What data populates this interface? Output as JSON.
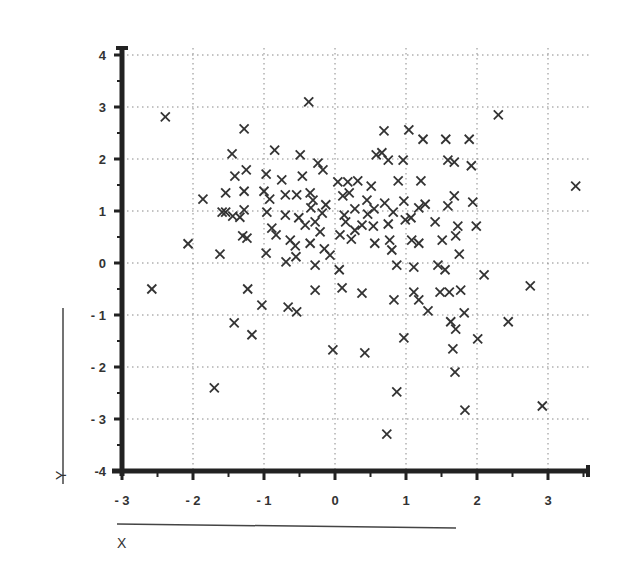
{
  "chart_data": {
    "type": "scatter",
    "title": "",
    "xlabel": "X",
    "ylabel": "Y",
    "xlim": [
      -3,
      3.6
    ],
    "ylim": [
      -4,
      4.3
    ],
    "xticks": [
      -3,
      -2,
      -1,
      0,
      1,
      2,
      3
    ],
    "yticks": [
      -4,
      -3,
      -2,
      -1,
      0,
      1,
      2,
      3,
      4
    ],
    "xtick_labels": [
      "- 3",
      "- 2",
      "- 1",
      "0",
      "1",
      "2",
      "3"
    ],
    "ytick_labels": [
      "-4",
      "- 3",
      "- 2",
      "- 1",
      "0",
      "1",
      "2",
      "3",
      "4"
    ],
    "grid": true,
    "grid_style": "dotted",
    "marker": "x",
    "marker_color": "#333333",
    "legend": null,
    "series": [
      {
        "name": "points",
        "points": [
          [
            -2.39,
            2.81
          ],
          [
            -2.58,
            -0.5
          ],
          [
            -2.07,
            0.37
          ],
          [
            -1.7,
            -2.4
          ],
          [
            -1.86,
            1.23
          ],
          [
            -1.62,
            0.17
          ],
          [
            -1.59,
            0.98
          ],
          [
            -1.28,
            2.58
          ],
          [
            -1.45,
            2.1
          ],
          [
            -1.41,
            1.67
          ],
          [
            -1.54,
            1.35
          ],
          [
            -1.54,
            0.98
          ],
          [
            -1.44,
            0.9
          ],
          [
            -1.34,
            0.88
          ],
          [
            -1.28,
            1.38
          ],
          [
            -1.25,
            1.79
          ],
          [
            -1.28,
            1.02
          ],
          [
            -1.3,
            0.52
          ],
          [
            -1.24,
            0.48
          ],
          [
            -1.42,
            -1.15
          ],
          [
            -1.23,
            -0.5
          ],
          [
            -1.17,
            -1.38
          ],
          [
            -0.97,
            1.71
          ],
          [
            -0.85,
            2.17
          ],
          [
            -1.0,
            1.38
          ],
          [
            -0.92,
            1.23
          ],
          [
            -0.96,
            0.98
          ],
          [
            -0.89,
            0.67
          ],
          [
            -0.83,
            0.54
          ],
          [
            -0.97,
            0.19
          ],
          [
            -1.03,
            -0.81
          ],
          [
            -0.66,
            -0.85
          ],
          [
            -0.54,
            -0.94
          ],
          [
            -0.75,
            1.6
          ],
          [
            -0.7,
            1.31
          ],
          [
            -0.54,
            1.31
          ],
          [
            -0.7,
            0.92
          ],
          [
            -0.63,
            0.44
          ],
          [
            -0.69,
            0.02
          ],
          [
            -0.56,
            0.33
          ],
          [
            -0.55,
            0.12
          ],
          [
            -0.49,
            2.08
          ],
          [
            -0.46,
            1.67
          ],
          [
            -0.51,
            0.87
          ],
          [
            -0.42,
            0.73
          ],
          [
            -0.34,
            1.06
          ],
          [
            -0.31,
            1.21
          ],
          [
            -0.35,
            1.35
          ],
          [
            -0.28,
            0.79
          ],
          [
            -0.35,
            0.38
          ],
          [
            -0.28,
            -0.04
          ],
          [
            -0.28,
            -0.52
          ],
          [
            -0.37,
            3.1
          ],
          [
            -0.24,
            1.92
          ],
          [
            -0.17,
            1.79
          ],
          [
            -0.18,
            0.96
          ],
          [
            -0.21,
            0.6
          ],
          [
            -0.15,
            0.27
          ],
          [
            -0.13,
            1.12
          ],
          [
            -0.07,
            0.15
          ],
          [
            -0.03,
            -1.67
          ],
          [
            0.04,
            1.56
          ],
          [
            0.11,
            1.29
          ],
          [
            0.13,
            0.92
          ],
          [
            0.15,
            0.79
          ],
          [
            0.07,
            0.54
          ],
          [
            0.18,
            1.56
          ],
          [
            0.23,
            0.46
          ],
          [
            0.1,
            -0.48
          ],
          [
            0.06,
            -0.13
          ],
          [
            0.28,
            1.04
          ],
          [
            0.28,
            0.63
          ],
          [
            0.2,
            1.35
          ],
          [
            0.32,
            1.58
          ],
          [
            0.38,
            0.73
          ],
          [
            0.45,
            1.21
          ],
          [
            0.46,
            0.94
          ],
          [
            0.51,
            1.48
          ],
          [
            0.54,
            0.71
          ],
          [
            0.55,
            1.04
          ],
          [
            0.56,
            0.38
          ],
          [
            0.38,
            -0.58
          ],
          [
            0.42,
            -1.73
          ],
          [
            0.58,
            2.08
          ],
          [
            0.66,
            2.12
          ],
          [
            0.69,
            2.54
          ],
          [
            0.75,
            1.98
          ],
          [
            0.7,
            1.15
          ],
          [
            0.75,
            0.75
          ],
          [
            0.77,
            0.44
          ],
          [
            0.73,
            -3.29
          ],
          [
            0.82,
            0.98
          ],
          [
            0.8,
            0.25
          ],
          [
            0.87,
            -0.04
          ],
          [
            0.83,
            -0.71
          ],
          [
            0.87,
            -2.48
          ],
          [
            0.96,
            1.98
          ],
          [
            0.97,
            1.19
          ],
          [
            0.99,
            0.83
          ],
          [
            0.89,
            1.58
          ],
          [
            0.97,
            -1.44
          ],
          [
            1.04,
            2.56
          ],
          [
            1.07,
            0.87
          ],
          [
            1.08,
            0.44
          ],
          [
            1.11,
            -0.08
          ],
          [
            1.11,
            -0.56
          ],
          [
            1.18,
            1.06
          ],
          [
            1.21,
            1.58
          ],
          [
            1.24,
            2.38
          ],
          [
            1.27,
            1.13
          ],
          [
            1.18,
            0.38
          ],
          [
            1.18,
            -0.71
          ],
          [
            1.31,
            -0.92
          ],
          [
            1.41,
            0.79
          ],
          [
            1.45,
            -0.04
          ],
          [
            1.48,
            -0.56
          ],
          [
            1.51,
            0.44
          ],
          [
            1.56,
            2.38
          ],
          [
            1.59,
            1.98
          ],
          [
            1.59,
            1.1
          ],
          [
            1.55,
            -0.13
          ],
          [
            1.61,
            -0.56
          ],
          [
            1.68,
            1.94
          ],
          [
            1.68,
            1.29
          ],
          [
            1.7,
            0.52
          ],
          [
            1.63,
            -1.13
          ],
          [
            1.66,
            -1.65
          ],
          [
            1.69,
            -2.1
          ],
          [
            1.73,
            0.71
          ],
          [
            1.75,
            0.17
          ],
          [
            1.77,
            -0.52
          ],
          [
            1.7,
            -1.27
          ],
          [
            1.82,
            -0.96
          ],
          [
            1.89,
            2.38
          ],
          [
            1.92,
            1.87
          ],
          [
            1.94,
            1.17
          ],
          [
            1.83,
            -2.83
          ],
          [
            1.99,
            0.71
          ],
          [
            2.01,
            -1.46
          ],
          [
            2.1,
            -0.23
          ],
          [
            2.3,
            2.85
          ],
          [
            2.44,
            -1.13
          ],
          [
            2.75,
            -0.44
          ],
          [
            2.92,
            -2.75
          ],
          [
            3.39,
            1.48
          ]
        ]
      }
    ]
  },
  "labels": {
    "x_axis_title": "X",
    "y_axis_title": "Y"
  }
}
